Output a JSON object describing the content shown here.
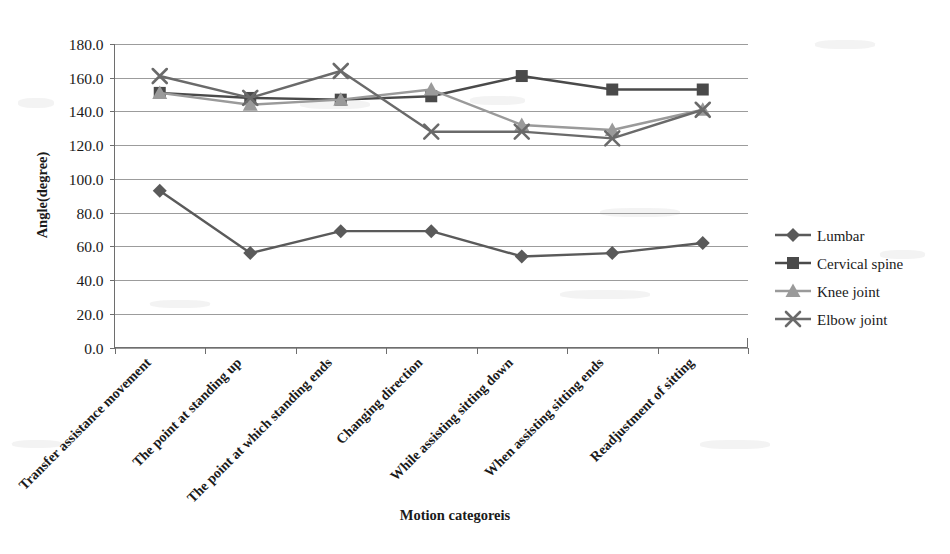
{
  "chart_data": {
    "type": "line",
    "title": "",
    "xlabel": "Motion categoreis",
    "ylabel": "Angle(degree)",
    "ylim": [
      0,
      180
    ],
    "ytick_step": 20,
    "ytick_labels": [
      "0.0",
      "20.0",
      "40.0",
      "60.0",
      "80.0",
      "100.0",
      "120.0",
      "140.0",
      "160.0",
      "180.0"
    ],
    "grid": true,
    "legend_position": "right",
    "categories": [
      "Transfer assistance movement",
      "The point at standing up",
      "The point at which standing ends",
      "Changing direction",
      "While assisting sitting down",
      "When assisting sitting ends",
      "Readjustment of sitting"
    ],
    "series": [
      {
        "name": "Lumbar",
        "marker": "diamond",
        "color": "#5a5a5a",
        "values": [
          93.0,
          56.0,
          69.0,
          69.0,
          54.0,
          56.0,
          62.0
        ]
      },
      {
        "name": "Cervical spine",
        "marker": "square",
        "color": "#4a4a4a",
        "values": [
          151.0,
          148.0,
          147.0,
          149.0,
          161.0,
          153.0,
          153.0
        ]
      },
      {
        "name": "Knee joint",
        "marker": "triangle",
        "color": "#9a9a9a",
        "values": [
          151.0,
          144.0,
          147.0,
          153.0,
          132.0,
          129.0,
          141.0
        ]
      },
      {
        "name": "Elbow joint",
        "marker": "cross",
        "color": "#6a6a6a",
        "values": [
          161.0,
          148.0,
          164.0,
          128.0,
          128.0,
          124.0,
          141.0
        ]
      }
    ]
  },
  "legend": {
    "items": [
      {
        "label": "Lumbar"
      },
      {
        "label": "Cervical spine"
      },
      {
        "label": "Knee joint"
      },
      {
        "label": "Elbow joint"
      }
    ]
  },
  "axes": {
    "y_title": "Angle(degree)",
    "x_title": "Motion categoreis"
  }
}
